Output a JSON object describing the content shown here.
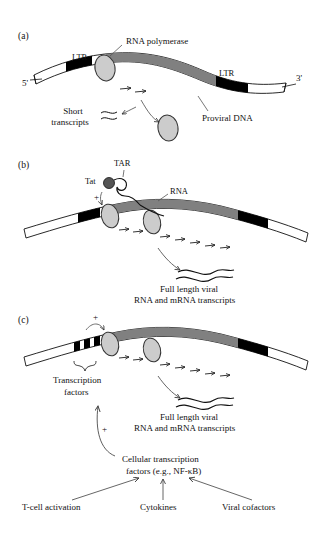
{
  "figure": {
    "background": "#ffffff",
    "ink": "#111111",
    "colors": {
      "dna_body_gray": "#808080",
      "ltr_black": "#000000",
      "polymerase_gray": "#cccccc",
      "polymerase_outline": "#333333",
      "tat_dark": "#555555",
      "leader_line": "#555555"
    }
  },
  "panels": [
    {
      "id": "a",
      "letter": "(a)",
      "labels": {
        "rna_polymerase": "RNA polymerase",
        "ltr_left": "LTR",
        "ltr_right": "LTR",
        "five_prime": "5'",
        "three_prime": "3'",
        "short_transcripts_line1": "Short",
        "short_transcripts_line2": "transcripts",
        "proviral_dna": "Proviral DNA"
      }
    },
    {
      "id": "b",
      "letter": "(b)",
      "labels": {
        "tar": "TAR",
        "tat": "Tat",
        "rna": "RNA",
        "plus": "+",
        "transcripts_line1": "Full length viral",
        "transcripts_line2": "RNA and mRNA transcripts"
      }
    },
    {
      "id": "c",
      "letter": "(c)",
      "labels": {
        "plus_top": "+",
        "transcription_factors_line1": "Transcription",
        "transcription_factors_line2": "factors",
        "transcripts_line1": "Full length viral",
        "transcripts_line2": "RNA and mRNA transcripts",
        "plus_feedback": "+"
      }
    }
  ],
  "pathway": {
    "cellular_line1": "Cellular transcription",
    "cellular_line2": "factors (e.g., NF-κB)",
    "inputs": [
      {
        "label": "T-cell activation"
      },
      {
        "label": "Cytokines"
      },
      {
        "label": "Viral cofactors"
      }
    ]
  }
}
